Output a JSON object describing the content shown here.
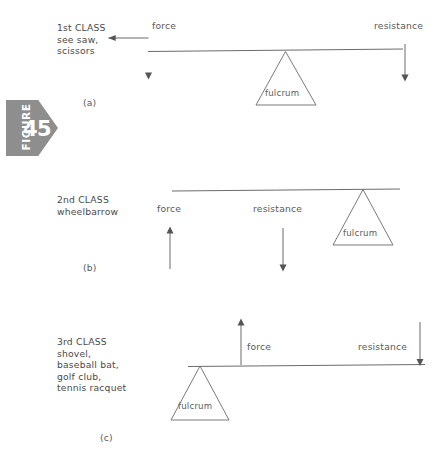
{
  "figure_tag": {
    "word": "FIGURE",
    "number": "45",
    "plate_color": "#8e8e8e",
    "text_color": "#ffffff"
  },
  "ink_color": "#555555",
  "panels": [
    {
      "id": "a",
      "caption": "(a)",
      "class_label": "1st CLASS\nsee saw,\nscissors",
      "force_label": "force",
      "resistance_label": "resistance",
      "fulcrum_label": "fulcrum",
      "fulcrum_position": "center",
      "force_direction": "down",
      "resistance_direction": "down"
    },
    {
      "id": "b",
      "caption": "(b)",
      "class_label": "2nd CLASS\nwheelbarrow",
      "force_label": "force",
      "resistance_label": "resistance",
      "fulcrum_label": "fulcrum",
      "fulcrum_position": "right",
      "force_direction": "up",
      "resistance_direction": "down"
    },
    {
      "id": "c",
      "caption": "(c)",
      "class_label": "3rd CLASS\nshovel,\nbaseball bat,\ngolf club,\ntennis racquet",
      "force_label": "force",
      "resistance_label": "resistance",
      "fulcrum_label": "fulcrum",
      "fulcrum_position": "left",
      "force_direction": "up",
      "resistance_direction": "down"
    }
  ]
}
